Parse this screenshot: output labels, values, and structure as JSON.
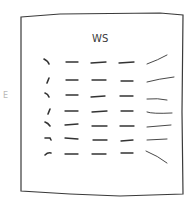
{
  "sheet": {
    "title": "WS",
    "margin_mark": "E",
    "stroke_color": "#333333",
    "rows": [
      {
        "lead": "hook",
        "cells": [
          "dash",
          "dash",
          "dash"
        ],
        "tail": "rising-curve"
      },
      {
        "lead": "comma",
        "cells": [
          "dash",
          "dash",
          "dash"
        ],
        "tail": "rising-line"
      },
      {
        "lead": "hook",
        "cells": [
          "dash",
          "dash",
          "dash"
        ],
        "tail": "flat-line"
      },
      {
        "lead": "comma",
        "cells": [
          "dash",
          "dash",
          "dash"
        ],
        "tail": "flat-curve"
      },
      {
        "lead": "hook",
        "cells": [
          "dash",
          "dash",
          "dash"
        ],
        "tail": "flat-line"
      },
      {
        "lead": "tick",
        "cells": [
          "dash",
          "dash",
          "dash"
        ],
        "tail": "flat-line"
      },
      {
        "lead": "arrow",
        "cells": [
          "dash",
          "dash",
          "dash"
        ],
        "tail": "falling-line"
      }
    ]
  }
}
